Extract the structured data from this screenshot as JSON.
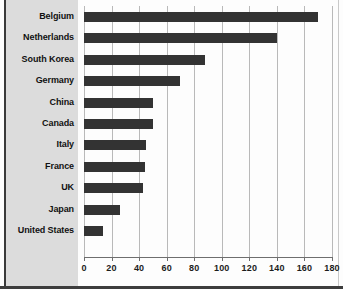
{
  "chart_data": {
    "type": "bar",
    "orientation": "horizontal",
    "title": "",
    "subtitle": "",
    "xlabel": "",
    "ylabel": "",
    "xlim": [
      0,
      180
    ],
    "ylim": null,
    "grid": true,
    "legend": null,
    "legend_position": "none",
    "xticks": [
      0,
      20,
      40,
      60,
      80,
      100,
      120,
      140,
      160,
      180
    ],
    "xtick_labels": [
      "0",
      "20",
      "40",
      "60",
      "80",
      "100",
      "120",
      "140",
      "160",
      "180"
    ],
    "categories": [
      "Belgium",
      "Netherlands",
      "South Korea",
      "Germany",
      "China",
      "Canada",
      "Italy",
      "France",
      "UK",
      "Japan",
      "United States"
    ],
    "values": [
      170,
      140,
      88,
      70,
      50,
      50,
      45,
      44,
      43,
      26,
      14
    ],
    "bar_color": "#333333",
    "grid_color": "#b9b9b9",
    "label_panel_color": "#dcdcdc",
    "plot_background": "#fdfdfd",
    "frame_color": "#3a3a3a",
    "annotations": []
  }
}
